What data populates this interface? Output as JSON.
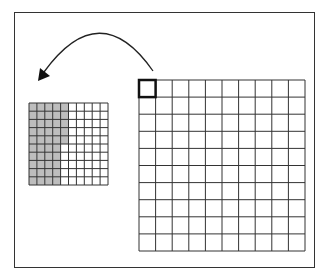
{
  "diagram": {
    "colors": {
      "line": "#333333",
      "shade": "#bdbdbd",
      "background": "#ffffff"
    },
    "large_grid": {
      "rows": 10,
      "cols": 10,
      "x": 139,
      "y": 80,
      "width": 166,
      "height": 171,
      "highlighted_cell": [
        0,
        0
      ]
    },
    "small_grid": {
      "rows": 10,
      "cols": 10,
      "x": 29,
      "y": 103,
      "width": 79,
      "height": 82,
      "shaded_cols_per_row": [
        5,
        5,
        5,
        5,
        5,
        4,
        4,
        4,
        4,
        4
      ],
      "shaded_total": 45
    },
    "arrow": {
      "from": [
        153,
        71
      ],
      "control": [
        100,
        -5
      ],
      "to": [
        38,
        81
      ]
    }
  }
}
